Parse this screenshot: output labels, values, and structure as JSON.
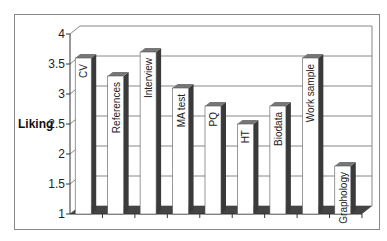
{
  "chart_data": {
    "type": "bar",
    "title": "",
    "xlabel": "",
    "ylabel": "Liking",
    "ylim": [
      1,
      4
    ],
    "yticks": [
      1,
      1.5,
      2,
      2.5,
      3,
      3.5,
      4
    ],
    "grid": true,
    "legend": null,
    "style": "3d-column",
    "categories": [
      "CV",
      "References",
      "Interview",
      "MA test",
      "PQ",
      "HT",
      "Biodata",
      "Work sample",
      "Graphology"
    ],
    "values": [
      3.6,
      3.3,
      3.7,
      3.1,
      2.8,
      2.5,
      2.8,
      3.6,
      1.8
    ],
    "bar_labels_inside": true
  },
  "colors": {
    "bar_face": "#ffffff",
    "bar_side": "#3a3a3a",
    "bar_top": "#777777",
    "floor": "#444444",
    "grid": "#888888"
  }
}
